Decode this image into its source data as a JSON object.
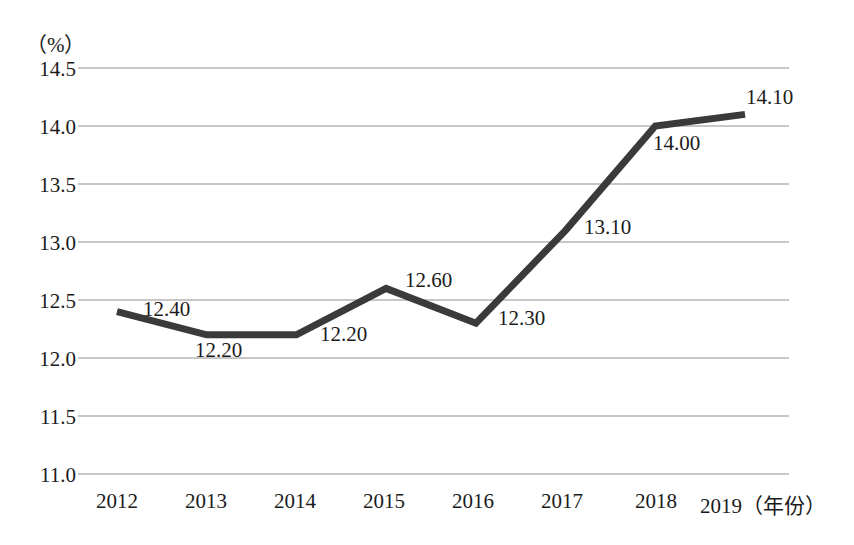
{
  "chart_data": {
    "type": "line",
    "title": "",
    "subtitle": "",
    "xlabel": "（年份）",
    "ylabel": "（%）",
    "categories": [
      "2012",
      "2013",
      "2014",
      "2015",
      "2016",
      "2017",
      "2018",
      "2019"
    ],
    "values": [
      12.4,
      12.2,
      12.2,
      12.6,
      12.3,
      13.1,
      14.0,
      14.1
    ],
    "data_labels": [
      "12.40",
      "12.20",
      "12.20",
      "12.60",
      "12.30",
      "13.10",
      "14.00",
      "14.10"
    ],
    "ylim": [
      11.0,
      14.5
    ],
    "yticks": [
      "14.5",
      "14.0",
      "13.5",
      "13.0",
      "12.5",
      "12.0",
      "11.5",
      "11.0"
    ],
    "ytick_values": [
      14.5,
      14.0,
      13.5,
      13.0,
      12.5,
      12.0,
      11.5,
      11.0
    ],
    "grid": true,
    "grid_axis": "y",
    "legend": false,
    "legend_position": "none",
    "series_color": "#3a3a3a",
    "grid_color": "#b5b5b5",
    "background_color": "#ffffff",
    "text_color": "#1b1b1b",
    "markers": false,
    "line_width": 7
  },
  "axis": {
    "y_unit_label": "（%）",
    "x_unit_label": "（年份）",
    "x_last_tick_combined": "2019（年份）"
  },
  "labels": {
    "y": {
      "t0": "14.5",
      "t1": "14.0",
      "t2": "13.5",
      "t3": "13.0",
      "t4": "12.5",
      "t5": "12.0",
      "t6": "11.5",
      "t7": "11.0"
    },
    "x": {
      "c0": "2012",
      "c1": "2013",
      "c2": "2014",
      "c3": "2015",
      "c4": "2016",
      "c5": "2017",
      "c6": "2018",
      "c7": "2019（年份）"
    },
    "points": {
      "p0": "12.40",
      "p1": "12.20",
      "p2": "12.20",
      "p3": "12.60",
      "p4": "12.30",
      "p5": "13.10",
      "p6": "14.00",
      "p7": "14.10"
    }
  }
}
